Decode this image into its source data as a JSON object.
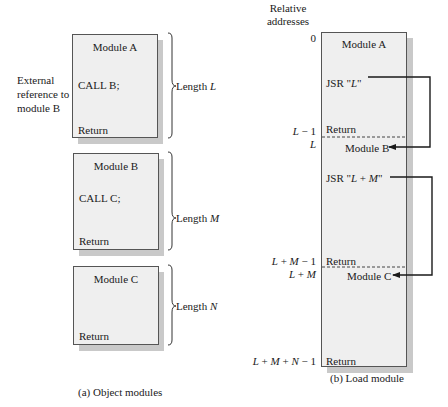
{
  "object_modules": {
    "caption": "(a) Object modules",
    "external_ref_label": [
      "External",
      "reference to",
      "module B"
    ],
    "modules": [
      {
        "title": "Module A",
        "call": "CALL B;",
        "end": "Return",
        "length_prefix": "Length ",
        "length_var": "L"
      },
      {
        "title": "Module B",
        "call": "CALL C;",
        "end": "Return",
        "length_prefix": "Length ",
        "length_var": "M"
      },
      {
        "title": "Module C",
        "call": "",
        "end": "Return",
        "length_prefix": "Length ",
        "length_var": "N"
      }
    ]
  },
  "load_module": {
    "caption": "(b) Load module",
    "address_header": [
      "Relative",
      "addresses"
    ],
    "sections": [
      {
        "title": "Module A",
        "jsr": "JSR \"L\"",
        "end": "Return"
      },
      {
        "title": "Module B",
        "jsr": "JSR \"L + M\"",
        "end": "Return"
      },
      {
        "title": "Module C",
        "jsr": "",
        "end": "Return"
      }
    ],
    "addresses": {
      "a0": "0",
      "l_minus_1": "L − 1",
      "l": "L",
      "lm_minus_1": "L + M − 1",
      "lm": "L + M",
      "lmn_minus_1": "L + M + N − 1"
    }
  },
  "colors": {
    "box_fill": "#efefef",
    "box_border": "#555555",
    "shadow": "#c9c9c9",
    "line": "#1a1a1a"
  }
}
